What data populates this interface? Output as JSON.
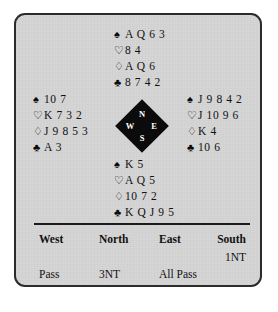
{
  "card": {
    "background_color": "#d6d6d6",
    "border_color": "#2b2b2b"
  },
  "suits": {
    "spade": "♠",
    "heart": "♡",
    "diamond": "♢",
    "club": "♣"
  },
  "compass": {
    "north": "N",
    "west": "W",
    "east": "E",
    "south": "S"
  },
  "hands": {
    "north": {
      "label": "North",
      "spades": "A Q 6 3",
      "hearts": "8 4",
      "diamonds": "A Q 6",
      "clubs": "8 7 4 2"
    },
    "west": {
      "label": "West",
      "spades": "10 7",
      "hearts": "K 7 3 2",
      "diamonds": "J 9 8 5 3",
      "clubs": "A 3"
    },
    "east": {
      "label": "East",
      "spades": "J 9 8 4 2",
      "hearts": "J 10 9 6",
      "diamonds": "K 4",
      "clubs": "10 6"
    },
    "south": {
      "label": "South",
      "spades": "K 5",
      "hearts": "A Q 5",
      "diamonds": "10 7 2",
      "clubs": "K Q J 9 5"
    }
  },
  "bidding": {
    "headers": {
      "west": "West",
      "north": "North",
      "east": "East",
      "south": "South"
    },
    "rows": [
      {
        "west": "",
        "north": "",
        "east": "",
        "south": "1NT"
      },
      {
        "west": "Pass",
        "north": "3NT",
        "east": "All Pass",
        "south": ""
      }
    ]
  }
}
